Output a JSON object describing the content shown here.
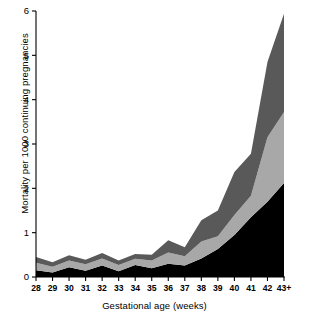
{
  "chart_data": {
    "type": "area",
    "title": "",
    "xlabel": "Gestational age (weeks)",
    "ylabel": "Mortality per 1000 continuing pregnancies",
    "categories": [
      "28",
      "29",
      "30",
      "31",
      "32",
      "33",
      "34",
      "35",
      "36",
      "37",
      "38",
      "39",
      "40",
      "41",
      "42",
      "43+"
    ],
    "xtick_labels": [
      "28",
      "29",
      "30",
      "31",
      "32",
      "33",
      "34",
      "35",
      "36",
      "37",
      "38",
      "39",
      "40",
      "41",
      "42",
      "43+"
    ],
    "ytick_labels": [
      "0",
      "1",
      "2",
      "3",
      "4",
      "5",
      "6"
    ],
    "ytick_values": [
      0,
      1,
      2,
      3,
      4,
      5,
      6
    ],
    "ylim": [
      0,
      6
    ],
    "grid": false,
    "legend": "none",
    "stacked": true,
    "series": [
      {
        "name": "bottom-band",
        "color": "#000000",
        "values": [
          0.15,
          0.1,
          0.22,
          0.14,
          0.26,
          0.13,
          0.27,
          0.2,
          0.3,
          0.26,
          0.42,
          0.63,
          0.95,
          1.35,
          1.7,
          2.12
        ]
      },
      {
        "name": "middle-band",
        "color": "#a8a8a8",
        "values": [
          0.17,
          0.13,
          0.15,
          0.15,
          0.16,
          0.14,
          0.14,
          0.17,
          0.25,
          0.21,
          0.38,
          0.29,
          0.45,
          0.48,
          1.45,
          1.6
        ]
      },
      {
        "name": "top-band",
        "color": "#595959",
        "values": [
          0.13,
          0.1,
          0.12,
          0.1,
          0.12,
          0.1,
          0.11,
          0.13,
          0.28,
          0.2,
          0.48,
          0.58,
          0.97,
          0.95,
          1.7,
          2.22
        ]
      }
    ],
    "totals": [
      0.45,
      0.33,
      0.49,
      0.39,
      0.54,
      0.37,
      0.52,
      0.5,
      0.83,
      0.67,
      1.28,
      1.5,
      2.37,
      2.78,
      4.85,
      5.94
    ]
  }
}
